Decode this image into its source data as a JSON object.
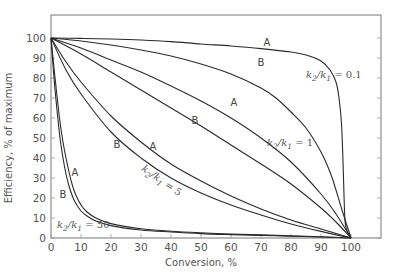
{
  "chart_data": {
    "type": "line",
    "title": "",
    "xlabel": "Conversion, %",
    "ylabel": "Efficiency, % of maximum",
    "xlim": [
      0,
      100
    ],
    "ylim": [
      0,
      100
    ],
    "x_ticks": [
      0,
      10,
      20,
      30,
      40,
      50,
      60,
      70,
      80,
      90,
      100
    ],
    "y_ticks": [
      0,
      10,
      20,
      30,
      40,
      50,
      60,
      70,
      80,
      90,
      100
    ],
    "grid": false,
    "legend": "none (curves labeled inline)",
    "series": [
      {
        "name": "k2/k1 = 0.1, A",
        "group": "0.1",
        "curve": "A",
        "points": [
          [
            0,
            100
          ],
          [
            10,
            99.8
          ],
          [
            20,
            99.5
          ],
          [
            30,
            99
          ],
          [
            40,
            98.2
          ],
          [
            50,
            97
          ],
          [
            60,
            96
          ],
          [
            70,
            94.7
          ],
          [
            80,
            93
          ],
          [
            85,
            91.5
          ],
          [
            90,
            88.5
          ],
          [
            93,
            84
          ],
          [
            95,
            78
          ],
          [
            96,
            70
          ],
          [
            96.8,
            58
          ],
          [
            97.3,
            40
          ],
          [
            97.7,
            20
          ],
          [
            98.2,
            6
          ],
          [
            100,
            0
          ]
        ]
      },
      {
        "name": "k2/k1 = 0.1, B",
        "group": "0.1",
        "curve": "B",
        "points": [
          [
            0,
            100
          ],
          [
            10,
            98.5
          ],
          [
            20,
            96.5
          ],
          [
            30,
            94
          ],
          [
            40,
            91
          ],
          [
            50,
            87
          ],
          [
            60,
            82
          ],
          [
            70,
            75
          ],
          [
            75,
            70
          ],
          [
            80,
            63
          ],
          [
            85,
            55
          ],
          [
            90,
            43
          ],
          [
            93,
            33
          ],
          [
            95,
            24
          ],
          [
            97,
            14
          ],
          [
            100,
            0
          ]
        ]
      },
      {
        "name": "k2/k1 = 1, A",
        "group": "1",
        "curve": "A",
        "points": [
          [
            0,
            100
          ],
          [
            10,
            95
          ],
          [
            20,
            89
          ],
          [
            30,
            83
          ],
          [
            40,
            76
          ],
          [
            50,
            68.5
          ],
          [
            60,
            60
          ],
          [
            70,
            50
          ],
          [
            80,
            38
          ],
          [
            90,
            22
          ],
          [
            95,
            12
          ],
          [
            100,
            0
          ]
        ]
      },
      {
        "name": "k2/k1 = 1, B",
        "group": "1",
        "curve": "B",
        "points": [
          [
            0,
            100
          ],
          [
            10,
            92
          ],
          [
            20,
            83
          ],
          [
            30,
            74
          ],
          [
            40,
            65
          ],
          [
            50,
            56
          ],
          [
            60,
            46.5
          ],
          [
            70,
            37
          ],
          [
            80,
            27
          ],
          [
            90,
            15
          ],
          [
            95,
            8
          ],
          [
            100,
            0
          ]
        ]
      },
      {
        "name": "k2/k1 = 5, A",
        "group": "5",
        "curve": "A",
        "points": [
          [
            0,
            100
          ],
          [
            5,
            88
          ],
          [
            10,
            78
          ],
          [
            20,
            61
          ],
          [
            30,
            48
          ],
          [
            40,
            37
          ],
          [
            50,
            28.5
          ],
          [
            60,
            21
          ],
          [
            70,
            14.5
          ],
          [
            80,
            9
          ],
          [
            90,
            4.5
          ],
          [
            100,
            0
          ]
        ]
      },
      {
        "name": "k2/k1 = 5, B",
        "group": "5",
        "curve": "B",
        "points": [
          [
            0,
            100
          ],
          [
            5,
            84
          ],
          [
            10,
            72
          ],
          [
            20,
            53
          ],
          [
            30,
            40
          ],
          [
            40,
            30
          ],
          [
            50,
            22.5
          ],
          [
            60,
            16.5
          ],
          [
            70,
            11.5
          ],
          [
            80,
            7
          ],
          [
            90,
            3.3
          ],
          [
            100,
            0
          ]
        ]
      },
      {
        "name": "k2/k1 = 50, A",
        "group": "50",
        "curve": "A",
        "points": [
          [
            0,
            100
          ],
          [
            1,
            85
          ],
          [
            2,
            71
          ],
          [
            3,
            58
          ],
          [
            4,
            48
          ],
          [
            5,
            40
          ],
          [
            6,
            33
          ],
          [
            7,
            27
          ],
          [
            8,
            22.5
          ],
          [
            10,
            16.5
          ],
          [
            12,
            13
          ],
          [
            15,
            10
          ],
          [
            20,
            7.2
          ],
          [
            30,
            4.6
          ],
          [
            40,
            3.4
          ],
          [
            50,
            2.6
          ],
          [
            60,
            2
          ],
          [
            75,
            1.3
          ],
          [
            90,
            0.6
          ],
          [
            100,
            0
          ]
        ]
      },
      {
        "name": "k2/k1 = 50, B",
        "group": "50",
        "curve": "B",
        "points": [
          [
            0,
            100
          ],
          [
            1,
            80
          ],
          [
            2,
            64
          ],
          [
            3,
            50
          ],
          [
            4,
            40
          ],
          [
            5,
            32
          ],
          [
            6,
            26
          ],
          [
            7,
            21.5
          ],
          [
            8,
            18
          ],
          [
            10,
            13.5
          ],
          [
            12,
            11
          ],
          [
            15,
            8.5
          ],
          [
            20,
            6.2
          ],
          [
            30,
            4
          ],
          [
            40,
            3
          ],
          [
            50,
            2.2
          ],
          [
            60,
            1.7
          ],
          [
            75,
            1.1
          ],
          [
            90,
            0.5
          ],
          [
            100,
            0
          ]
        ]
      }
    ],
    "annotations": [
      {
        "text": "A",
        "x": 72,
        "y": 96,
        "series": "k2/k1 = 0.1, A"
      },
      {
        "text": "B",
        "x": 70,
        "y": 86,
        "series": "k2/k1 = 0.1, B"
      },
      {
        "text": "k2/k1 = 0.1",
        "x": 85,
        "y": 80
      },
      {
        "text": "A",
        "x": 61,
        "y": 66,
        "series": "k2/k1 = 1, A"
      },
      {
        "text": "B",
        "x": 48,
        "y": 57,
        "series": "k2/k1 = 1, B"
      },
      {
        "text": "k2/k1 = 1",
        "x": 72,
        "y": 46
      },
      {
        "text": "A",
        "x": 34,
        "y": 44,
        "series": "k2/k1 = 5, A"
      },
      {
        "text": "B",
        "x": 22,
        "y": 45,
        "series": "k2/k1 = 5, B"
      },
      {
        "text": "k2/k1 = 5",
        "x": 30,
        "y": 34,
        "rotation": 35
      },
      {
        "text": "A",
        "x": 8,
        "y": 31,
        "series": "k2/k1 = 50, A"
      },
      {
        "text": "B",
        "x": 4,
        "y": 20,
        "series": "k2/k1 = 50, B"
      },
      {
        "text": "k2/k1 = 50",
        "x": 2,
        "y": 5
      }
    ]
  },
  "labels": {
    "xlabel": "Conversion, %",
    "ylabel": "Efficiency, % of maximum",
    "ratio_prefix_k": "k",
    "ratio_sub_2": "2",
    "ratio_slash": "/",
    "ratio_sub_1": "1"
  }
}
